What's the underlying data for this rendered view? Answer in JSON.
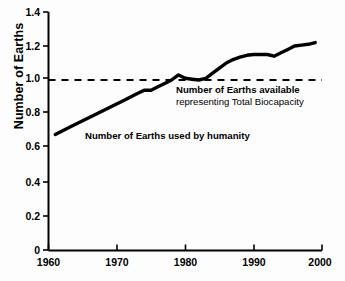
{
  "chart_data": {
    "type": "line",
    "title": "",
    "xlabel": "",
    "ylabel": "Number of Earths",
    "xlim": [
      1960,
      2000
    ],
    "ylim": [
      0,
      1.4
    ],
    "grid": false,
    "legend_position": "inline-annotations",
    "x_ticks": [
      "1960",
      "1970",
      "1980",
      "1990",
      "2000"
    ],
    "x_tick_values": [
      1960,
      1970,
      1980,
      1990,
      2000
    ],
    "y_ticks": [
      "0",
      "0.2",
      "0.4",
      "0.6",
      "0.8",
      "1.0",
      "1.2",
      "1.4"
    ],
    "y_tick_values": [
      0,
      0.2,
      0.4,
      0.6,
      0.8,
      1.0,
      1.2,
      1.4
    ],
    "series": [
      {
        "name": "Number of Earths used by humanity",
        "style": "solid",
        "color": "#000000",
        "x": [
          1961,
          1963,
          1965,
          1967,
          1969,
          1971,
          1973,
          1974,
          1975,
          1976,
          1977,
          1978,
          1979,
          1980,
          1981,
          1982,
          1983,
          1984,
          1985,
          1986,
          1987,
          1988,
          1989,
          1990,
          1991,
          1992,
          1993,
          1994,
          1995,
          1996,
          1997,
          1998,
          1999
        ],
        "values": [
          0.68,
          0.72,
          0.76,
          0.8,
          0.84,
          0.88,
          0.92,
          0.94,
          0.94,
          0.96,
          0.98,
          1.0,
          1.03,
          1.01,
          1.005,
          1.0,
          1.01,
          1.04,
          1.07,
          1.1,
          1.12,
          1.135,
          1.145,
          1.15,
          1.15,
          1.15,
          1.14,
          1.16,
          1.18,
          1.2,
          1.205,
          1.21,
          1.22
        ]
      },
      {
        "name": "Number of Earths available",
        "style": "dashed",
        "color": "#000000",
        "x": [
          1960,
          2000
        ],
        "values": [
          1.0,
          1.0
        ]
      }
    ],
    "annotations": [
      {
        "id": "biocapacity-annotation",
        "line1": "Number of Earths available",
        "line2": "representing Total Biocapacity",
        "x": 1982.5,
        "y": 0.92
      },
      {
        "id": "humanity-annotation",
        "text": "Number of Earths used by humanity",
        "x": 1970.5,
        "y": 0.74
      }
    ]
  },
  "colors": {
    "background": "#fdfdfd",
    "axis": "#000000",
    "curve": "#000000",
    "text": "#000000"
  }
}
